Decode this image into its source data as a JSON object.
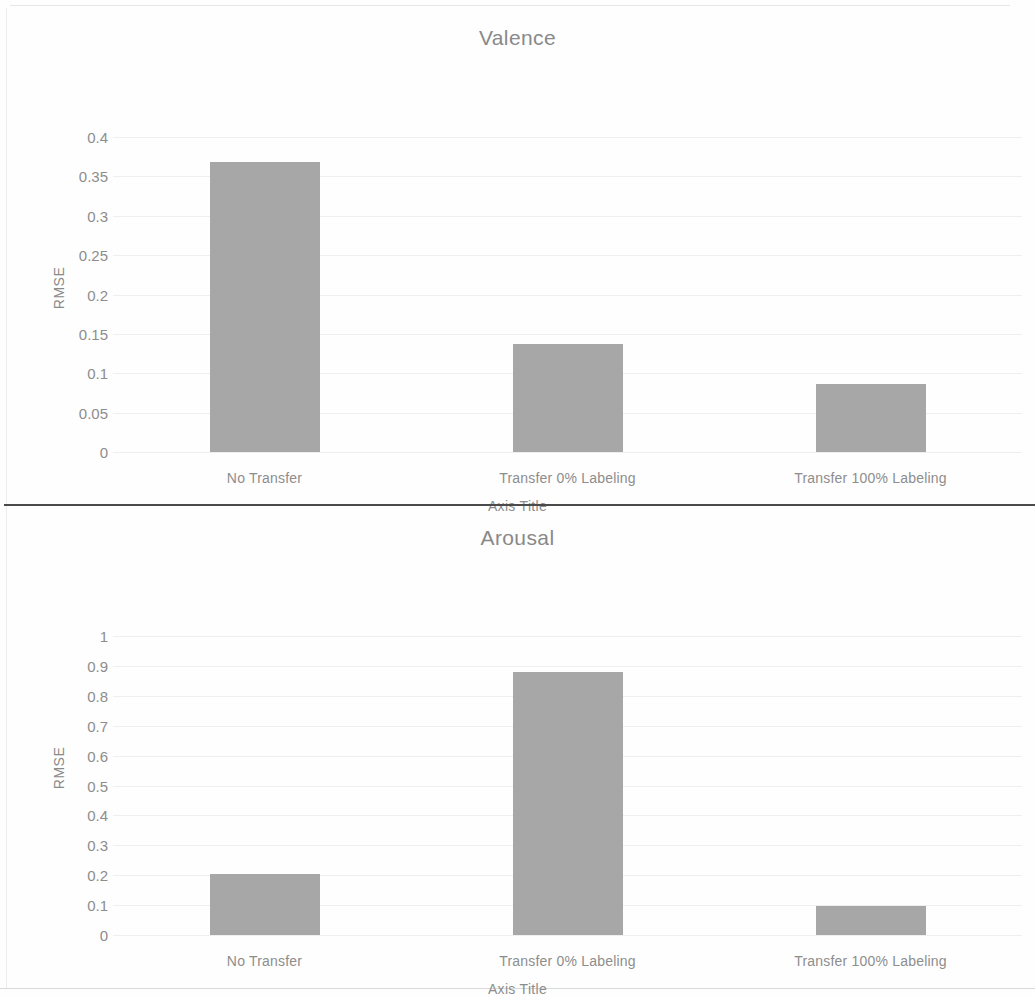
{
  "document": {
    "kind": "scanned-figure-page"
  },
  "charts": [
    {
      "id": "valence",
      "title": "Valence",
      "ylabel": "RMSE",
      "xlabel": "Axis Title",
      "categories": [
        "No Transfer",
        "Transfer 0% Labeling",
        "Transfer 100% Labeling"
      ],
      "values": [
        0.368,
        0.137,
        0.086
      ],
      "yticks": [
        "0.4",
        "0.35",
        "0.3",
        "0.25",
        "0.2",
        "0.15",
        "0.1",
        "0.05",
        "0"
      ],
      "ymin": 0,
      "ymax": 0.4,
      "ystep": 0.05
    },
    {
      "id": "arousal",
      "title": "Arousal",
      "ylabel": "RMSE",
      "xlabel": "Axis Title",
      "categories": [
        "No Transfer",
        "Transfer 0% Labeling",
        "Transfer 100% Labeling"
      ],
      "values": [
        0.205,
        0.88,
        0.098
      ],
      "yticks": [
        "1",
        "0.9",
        "0.8",
        "0.7",
        "0.6",
        "0.5",
        "0.4",
        "0.3",
        "0.2",
        "0.1",
        "0"
      ],
      "ymin": 0,
      "ymax": 1,
      "ystep": 0.1
    }
  ],
  "chart_data": [
    {
      "type": "bar",
      "title": "Valence",
      "xlabel": "Axis Title",
      "ylabel": "RMSE",
      "categories": [
        "No Transfer",
        "Transfer 0% Labeling",
        "Transfer 100% Labeling"
      ],
      "values": [
        0.368,
        0.137,
        0.086
      ],
      "ylim": [
        0,
        0.4
      ],
      "ytick_step": 0.05,
      "grid": true,
      "legend": "none",
      "bar_color": "#a7a7a7"
    },
    {
      "type": "bar",
      "title": "Arousal",
      "xlabel": "Axis Title",
      "ylabel": "RMSE",
      "categories": [
        "No Transfer",
        "Transfer 0% Labeling",
        "Transfer 100% Labeling"
      ],
      "values": [
        0.205,
        0.88,
        0.098
      ],
      "ylim": [
        0,
        1
      ],
      "ytick_step": 0.1,
      "grid": true,
      "legend": "none",
      "bar_color": "#a7a7a7"
    }
  ],
  "colors": {
    "bar": "#a7a7a7",
    "grid": "#efefef",
    "text": "#8d8d8d",
    "divider": "#4a4a4a",
    "background": "#ffffff"
  }
}
